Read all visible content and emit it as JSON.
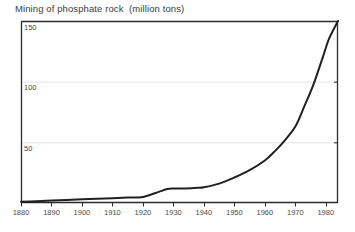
{
  "chart_data": {
    "type": "line",
    "title": "Mining of phosphate rock  (million tons)",
    "xlabel": "",
    "ylabel": "",
    "xlim": [
      1880,
      1984
    ],
    "ylim": [
      0,
      150
    ],
    "grid": true,
    "grid_lines_y": [
      50,
      100,
      150
    ],
    "legend": null,
    "xticks": [
      "1880",
      "1890",
      "1900",
      "1910",
      "1920",
      "1930",
      "1940",
      "1950",
      "1960",
      "1970",
      "1980"
    ],
    "xtick_values": [
      1880,
      1890,
      1900,
      1910,
      1920,
      1930,
      1940,
      1950,
      1960,
      1970,
      1980
    ],
    "yticks": [
      "50",
      "100",
      "150"
    ],
    "ytick_values": [
      50,
      100,
      150
    ],
    "series": [
      {
        "name": "Mining of phosphate rock",
        "x": [
          1880,
          1885,
          1890,
          1895,
          1900,
          1905,
          1910,
          1915,
          1920,
          1925,
          1928,
          1930,
          1934,
          1938,
          1940,
          1945,
          1950,
          1955,
          1960,
          1963,
          1966,
          1970,
          1973,
          1976,
          1979,
          1981,
          1984
        ],
        "values": [
          1,
          1.5,
          2,
          2.5,
          3,
          3.5,
          4,
          4.5,
          5,
          9,
          11.5,
          12,
          12,
          12.5,
          13,
          16,
          21,
          27,
          35,
          42,
          50,
          63,
          80,
          98,
          120,
          135,
          150
        ]
      }
    ],
    "colors": {
      "line": "#231f20",
      "axis": "#2b2b2b",
      "gridline": "#e4e4e4",
      "text": "#3b3b3b",
      "background": "#ffffff"
    }
  },
  "plot_geometry": {
    "left": 21,
    "right": 338,
    "top": 21,
    "bottom": 203
  }
}
